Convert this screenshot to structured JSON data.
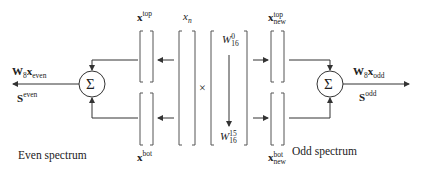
{
  "diagram": {
    "left": {
      "output_label_main": "W",
      "output_label_sub1": "8",
      "output_label_x": "x",
      "output_label_sub2": "even",
      "spectrum_label_main": "S",
      "spectrum_label_sup": "even",
      "caption": "Even spectrum",
      "sum_symbol": "Σ"
    },
    "inputs": {
      "x_top_main": "x",
      "x_top_sup": "top",
      "x_bot_main": "x",
      "x_bot_sup": "bot",
      "x_n_main": "x",
      "x_n_sub": "n"
    },
    "multiply_symbol": "×",
    "twiddle": {
      "top_main": "W",
      "top_sup": "0",
      "top_sub": "16",
      "bottom_main": "W",
      "bottom_sup": "15",
      "bottom_sub": "16"
    },
    "right": {
      "x_new_top_main": "x",
      "x_new_top_sup": "top",
      "x_new_top_sub": "new",
      "x_new_bot_main": "x",
      "x_new_bot_sup": "bot",
      "x_new_bot_sub": "new",
      "output_label_main": "W",
      "output_label_sub1": "8",
      "output_label_x": "x",
      "output_label_sub2": "odd",
      "spectrum_label_main": "S",
      "spectrum_label_sup": "odd",
      "caption": "Odd spectrum",
      "sum_symbol": "Σ"
    },
    "colors": {
      "line": "#333333",
      "bracket": "#555555"
    }
  }
}
